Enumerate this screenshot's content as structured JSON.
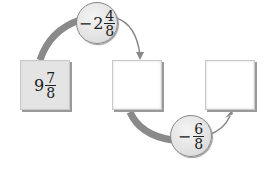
{
  "start": {
    "whole": "9",
    "numerator": "7",
    "denominator": "8"
  },
  "step1": {
    "sign": "−",
    "whole": "2",
    "numerator": "4",
    "denominator": "8"
  },
  "step2": {
    "sign": "−",
    "numerator": "6",
    "denominator": "8"
  },
  "boxes": [
    "",
    ""
  ]
}
